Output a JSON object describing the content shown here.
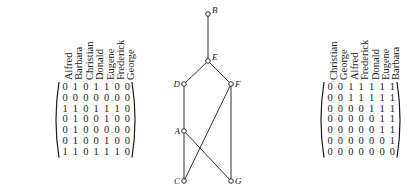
{
  "left_matrix": {
    "row_labels": [
      "Alfred",
      "Barbara",
      "Christian",
      "Donald",
      "Eugene",
      "Frederick",
      "George"
    ],
    "col_labels": [
      "Alfred",
      "Barbara",
      "Christian",
      "Donald",
      "Eugene",
      "Frederick",
      "George"
    ],
    "rows": [
      [
        "0",
        "1",
        "0",
        "1",
        "1",
        "0",
        "0"
      ],
      [
        "0",
        "0",
        "0",
        "0",
        "0",
        "0",
        "0"
      ],
      [
        "1",
        "1",
        "0",
        "1",
        "1",
        "1",
        "0"
      ],
      [
        "0",
        "1",
        "0",
        "0",
        "1",
        "0",
        "0"
      ],
      [
        "0",
        "1",
        "0",
        "0",
        "0",
        "0",
        "0"
      ],
      [
        "0",
        "1",
        "0",
        "0",
        "1",
        "0",
        "0"
      ],
      [
        "1",
        "1",
        "0",
        "1",
        "1",
        "1",
        "0"
      ]
    ]
  },
  "graph": {
    "nodes": [
      {
        "id": "B",
        "label": "B",
        "x": 208,
        "y": 14,
        "label_side": "right"
      },
      {
        "id": "E",
        "label": "E",
        "x": 208,
        "y": 61,
        "label_side": "right"
      },
      {
        "id": "D",
        "label": "D",
        "x": 184,
        "y": 84,
        "label_side": "left"
      },
      {
        "id": "F",
        "label": "F",
        "x": 231,
        "y": 84,
        "label_side": "right"
      },
      {
        "id": "A",
        "label": "A",
        "x": 184,
        "y": 131,
        "label_side": "left"
      },
      {
        "id": "C",
        "label": "C",
        "x": 184,
        "y": 181,
        "label_side": "left"
      },
      {
        "id": "G",
        "label": "G",
        "x": 231,
        "y": 181,
        "label_side": "right"
      }
    ],
    "edges": [
      [
        "B",
        "E"
      ],
      [
        "E",
        "D"
      ],
      [
        "E",
        "F"
      ],
      [
        "D",
        "A"
      ],
      [
        "A",
        "C"
      ],
      [
        "A",
        "G"
      ],
      [
        "F",
        "C"
      ],
      [
        "F",
        "G"
      ]
    ]
  },
  "right_matrix": {
    "row_labels": [
      "Christian",
      "George",
      "Alfred",
      "Frederick",
      "Donald",
      "Eugene",
      "Barbara"
    ],
    "col_labels": [
      "Christian",
      "George",
      "Alfred",
      "Frederick",
      "Donald",
      "Eugene",
      "Barbara"
    ],
    "rows": [
      [
        "0",
        "0",
        "1",
        "1",
        "1",
        "1",
        "1"
      ],
      [
        "0",
        "0",
        "1",
        "1",
        "1",
        "1",
        "1"
      ],
      [
        "0",
        "0",
        "0",
        "0",
        "1",
        "1",
        "1"
      ],
      [
        "0",
        "0",
        "0",
        "0",
        "0",
        "1",
        "1"
      ],
      [
        "0",
        "0",
        "0",
        "0",
        "0",
        "1",
        "1"
      ],
      [
        "0",
        "0",
        "0",
        "0",
        "0",
        "0",
        "1"
      ],
      [
        "0",
        "0",
        "0",
        "0",
        "0",
        "0",
        "0"
      ]
    ]
  }
}
